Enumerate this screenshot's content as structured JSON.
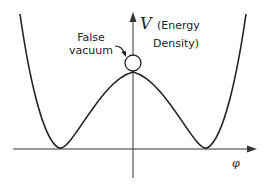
{
  "diagram": {
    "type": "potential-energy-curve",
    "axes": {
      "y_label_symbol": "V",
      "y_label_text_line1": "(Energy",
      "y_label_text_line2": "Density)",
      "x_label": "φ"
    },
    "annotations": {
      "false_vacuum_line1": "False",
      "false_vacuum_line2": "vacuum"
    },
    "colors": {
      "line": "#222222",
      "background": "#ffffff"
    }
  }
}
